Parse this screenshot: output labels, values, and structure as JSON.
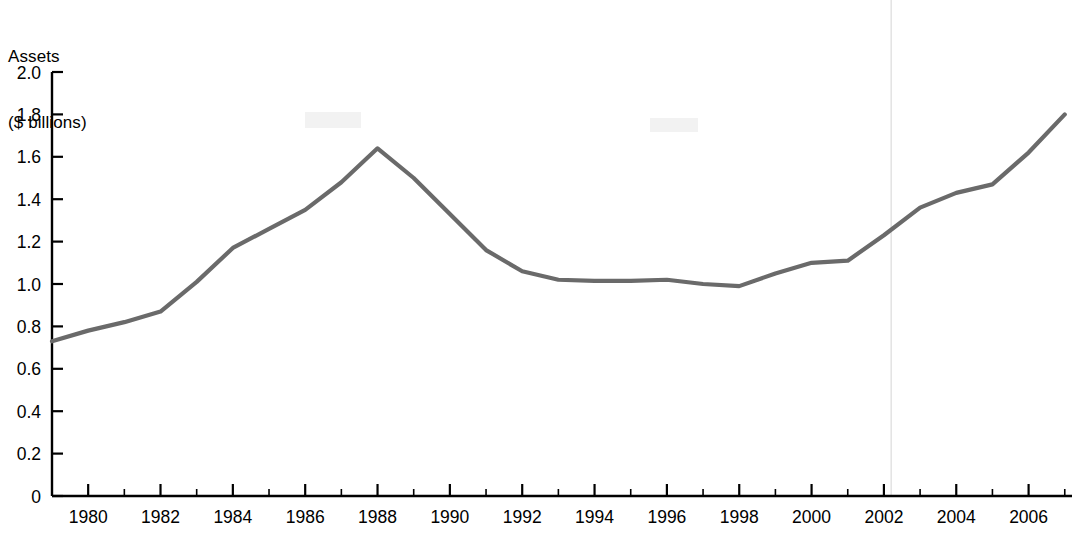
{
  "chart_data": {
    "type": "line",
    "title": "",
    "ylabel": "Assets\n($ billions)",
    "ylabel_lines": [
      "Assets",
      "($ billions)"
    ],
    "xlabel": "",
    "ylim": [
      0,
      2.0
    ],
    "xlim": [
      1979,
      2007.2
    ],
    "grid": false,
    "legend": null,
    "series": [
      {
        "name": "Assets",
        "color": "#6a6a6a",
        "x": [
          1979,
          1980,
          1981,
          1982,
          1983,
          1984,
          1985,
          1986,
          1987,
          1988,
          1989,
          1990,
          1991,
          1992,
          1993,
          1994,
          1995,
          1996,
          1997,
          1998,
          1999,
          2000,
          2001,
          2002,
          2003,
          2004,
          2005,
          2006,
          2007
        ],
        "values": [
          0.73,
          0.78,
          0.82,
          0.87,
          1.01,
          1.17,
          1.26,
          1.35,
          1.48,
          1.64,
          1.5,
          1.33,
          1.16,
          1.06,
          1.02,
          1.015,
          1.015,
          1.02,
          1.0,
          0.99,
          1.05,
          1.1,
          1.11,
          1.23,
          1.36,
          1.43,
          1.47,
          1.62,
          1.8
        ]
      }
    ],
    "yticks": [
      {
        "value": 2.0,
        "label": "2.0"
      },
      {
        "value": 1.8,
        "label": "1.8"
      },
      {
        "value": 1.6,
        "label": "1.6"
      },
      {
        "value": 1.4,
        "label": "1.4"
      },
      {
        "value": 1.2,
        "label": "1.2"
      },
      {
        "value": 1.0,
        "label": "1.0"
      },
      {
        "value": 0.8,
        "label": "0.8"
      },
      {
        "value": 0.6,
        "label": "0.6"
      },
      {
        "value": 0.4,
        "label": "0.4"
      },
      {
        "value": 0.2,
        "label": "0.2"
      },
      {
        "value": 0.0,
        "label": "0"
      }
    ],
    "xticks": [
      {
        "value": 1979,
        "label": ""
      },
      {
        "value": 1980,
        "label": "1980"
      },
      {
        "value": 1981,
        "label": ""
      },
      {
        "value": 1982,
        "label": "1982"
      },
      {
        "value": 1983,
        "label": ""
      },
      {
        "value": 1984,
        "label": "1984"
      },
      {
        "value": 1985,
        "label": ""
      },
      {
        "value": 1986,
        "label": "1986"
      },
      {
        "value": 1987,
        "label": ""
      },
      {
        "value": 1988,
        "label": "1988"
      },
      {
        "value": 1989,
        "label": ""
      },
      {
        "value": 1990,
        "label": "1990"
      },
      {
        "value": 1991,
        "label": ""
      },
      {
        "value": 1992,
        "label": "1992"
      },
      {
        "value": 1993,
        "label": ""
      },
      {
        "value": 1994,
        "label": "1994"
      },
      {
        "value": 1995,
        "label": ""
      },
      {
        "value": 1996,
        "label": "1996"
      },
      {
        "value": 1997,
        "label": ""
      },
      {
        "value": 1998,
        "label": "1998"
      },
      {
        "value": 1999,
        "label": ""
      },
      {
        "value": 2000,
        "label": "2000"
      },
      {
        "value": 2001,
        "label": ""
      },
      {
        "value": 2002,
        "label": "2002"
      },
      {
        "value": 2003,
        "label": ""
      },
      {
        "value": 2004,
        "label": "2004"
      },
      {
        "value": 2005,
        "label": ""
      },
      {
        "value": 2006,
        "label": "2006"
      },
      {
        "value": 2007,
        "label": ""
      }
    ],
    "annotations": [
      {
        "type": "vertical-line",
        "name": "year-2002-marker",
        "x": 2002.2,
        "color": "#d8d8d8"
      }
    ],
    "colors": {
      "line": "#6a6a6a",
      "axis": "#000000",
      "marker": "#d8d8d8",
      "background": "#ffffff"
    }
  }
}
